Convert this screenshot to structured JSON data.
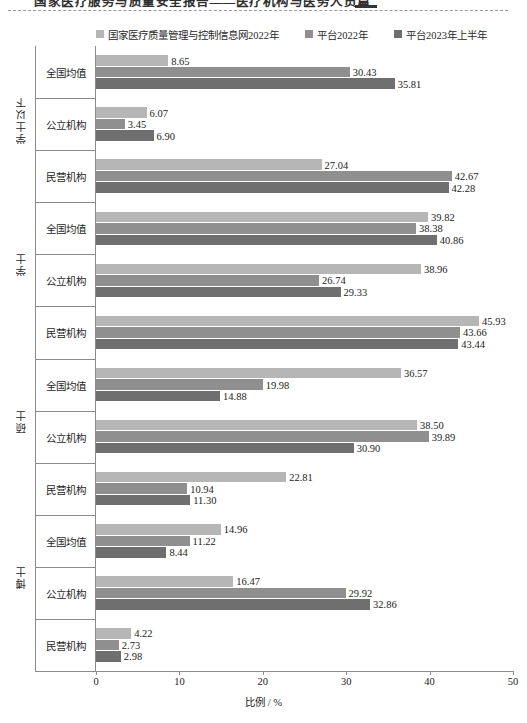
{
  "page_header": {
    "text": "国家医疗服务与质量安全报告——医疗机构与医务人员篇",
    "rule_style": "dashed"
  },
  "legend": {
    "position": "top-center",
    "entries": [
      {
        "label": "国家医疗质量管理与控制信息网2022年",
        "color": "#b6b6b6",
        "icon": "square-swatch"
      },
      {
        "label": "平台2022年",
        "color": "#8f8f8f",
        "icon": "square-swatch"
      },
      {
        "label": "平台2023年上半年",
        "color": "#6f6f6f",
        "icon": "square-swatch"
      }
    ]
  },
  "chart_data": {
    "type": "bar",
    "orientation": "horizontal",
    "title": "",
    "subtitle": "",
    "xlabel": "比例 / %",
    "ylabel": "",
    "xlim": [
      0,
      50
    ],
    "xticks": [
      0,
      10,
      20,
      30,
      40,
      50
    ],
    "grid": false,
    "legend_position": "top-center",
    "series": [
      {
        "name": "国家医疗质量管理与控制信息网2022年",
        "color": "#b6b6b6"
      },
      {
        "name": "平台2022年",
        "color": "#8f8f8f"
      },
      {
        "name": "平台2023年上半年",
        "color": "#6f6f6f"
      }
    ],
    "tiers": [
      {
        "name": "学士以下",
        "groups": [
          {
            "category": "全国均值",
            "values": [
              8.65,
              30.43,
              35.81
            ]
          },
          {
            "category": "公立机构",
            "values": [
              6.07,
              3.45,
              6.9
            ]
          },
          {
            "category": "民营机构",
            "values": [
              27.04,
              42.67,
              42.28
            ]
          }
        ]
      },
      {
        "name": "学士",
        "groups": [
          {
            "category": "全国均值",
            "values": [
              39.82,
              38.38,
              40.86
            ]
          },
          {
            "category": "公立机构",
            "values": [
              38.96,
              26.74,
              29.33
            ]
          },
          {
            "category": "民营机构",
            "values": [
              45.93,
              43.66,
              43.44
            ]
          }
        ]
      },
      {
        "name": "硕士",
        "groups": [
          {
            "category": "全国均值",
            "values": [
              36.57,
              19.98,
              14.88
            ]
          },
          {
            "category": "公立机构",
            "values": [
              38.5,
              39.89,
              30.9
            ]
          },
          {
            "category": "民营机构",
            "values": [
              22.81,
              10.94,
              11.3
            ]
          }
        ]
      },
      {
        "name": "博士",
        "groups": [
          {
            "category": "全国均值",
            "values": [
              14.96,
              11.22,
              8.44
            ]
          },
          {
            "category": "公立机构",
            "values": [
              16.47,
              29.92,
              32.86
            ]
          },
          {
            "category": "民营机构",
            "values": [
              4.22,
              2.73,
              2.98
            ]
          }
        ]
      }
    ]
  }
}
